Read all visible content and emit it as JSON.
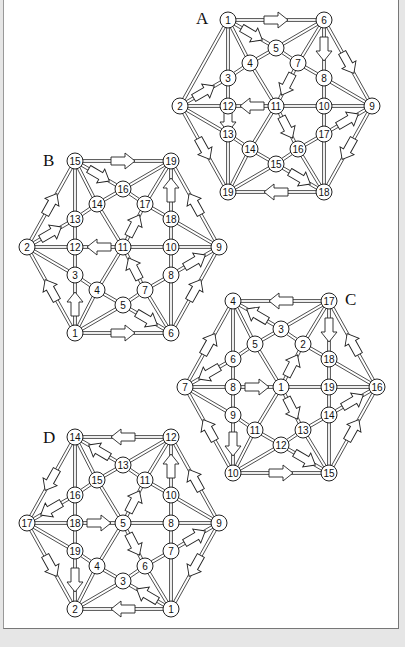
{
  "colors": {
    "background": "#e6e6e6",
    "panel": "#ffffff",
    "ink": "#222222"
  },
  "template": {
    "slots": {
      "L": [
        0,
        0
      ],
      "TL": [
        48,
        -86
      ],
      "TR": [
        144,
        -86
      ],
      "R": [
        192,
        0
      ],
      "BR": [
        144,
        86
      ],
      "BL": [
        48,
        86
      ],
      "a": [
        96,
        -58
      ],
      "b": [
        70,
        -43
      ],
      "c": [
        118,
        -43
      ],
      "d": [
        48,
        -28
      ],
      "e": [
        144,
        -28
      ],
      "f": [
        48,
        0
      ],
      "g": [
        96,
        0
      ],
      "h": [
        144,
        0
      ],
      "i": [
        48,
        28
      ],
      "j": [
        144,
        28
      ],
      "k": [
        70,
        43
      ],
      "l": [
        118,
        43
      ],
      "m": [
        96,
        58
      ]
    },
    "edges": [
      [
        "L",
        "TL"
      ],
      [
        "TL",
        "TR"
      ],
      [
        "TR",
        "R"
      ],
      [
        "R",
        "BR"
      ],
      [
        "BR",
        "BL"
      ],
      [
        "BL",
        "L"
      ],
      [
        "TL",
        "a"
      ],
      [
        "TL",
        "b"
      ],
      [
        "TL",
        "d"
      ],
      [
        "TR",
        "a"
      ],
      [
        "TR",
        "c"
      ],
      [
        "TR",
        "e"
      ],
      [
        "R",
        "e"
      ],
      [
        "R",
        "h"
      ],
      [
        "R",
        "j"
      ],
      [
        "BR",
        "j"
      ],
      [
        "BR",
        "l"
      ],
      [
        "BR",
        "m"
      ],
      [
        "BL",
        "m"
      ],
      [
        "BL",
        "k"
      ],
      [
        "BL",
        "i"
      ],
      [
        "L",
        "d"
      ],
      [
        "L",
        "f"
      ],
      [
        "L",
        "i"
      ],
      [
        "a",
        "b"
      ],
      [
        "a",
        "c"
      ],
      [
        "b",
        "d"
      ],
      [
        "c",
        "e"
      ],
      [
        "d",
        "f"
      ],
      [
        "f",
        "i"
      ],
      [
        "i",
        "k"
      ],
      [
        "k",
        "m"
      ],
      [
        "m",
        "l"
      ],
      [
        "l",
        "j"
      ],
      [
        "j",
        "h"
      ],
      [
        "h",
        "e"
      ],
      [
        "b",
        "g"
      ],
      [
        "c",
        "g"
      ],
      [
        "f",
        "g"
      ],
      [
        "g",
        "h"
      ],
      [
        "g",
        "k"
      ],
      [
        "g",
        "l"
      ]
    ]
  },
  "diagrams": [
    {
      "label": "A",
      "origin": [
        180,
        106
      ],
      "label_pos": [
        196,
        24
      ],
      "nodes": {
        "L": "2",
        "TL": "1",
        "TR": "6",
        "R": "9",
        "BR": "18",
        "BL": "19",
        "a": "5",
        "b": "4",
        "c": "7",
        "d": "3",
        "e": "8",
        "f": "12",
        "g": "11",
        "h": "10",
        "i": "13",
        "j": "17",
        "k": "14",
        "l": "16",
        "m": "15"
      },
      "arrows": [
        [
          "TL",
          "TR"
        ],
        [
          "TL",
          "a"
        ],
        [
          "TR",
          "e"
        ],
        [
          "TR",
          "R"
        ],
        [
          "L",
          "d"
        ],
        [
          "g",
          "f"
        ],
        [
          "c",
          "g"
        ],
        [
          "g",
          "l"
        ],
        [
          "f",
          "i"
        ],
        [
          "L",
          "BL"
        ],
        [
          "R",
          "BR"
        ],
        [
          "j",
          "R"
        ],
        [
          "m",
          "BR"
        ],
        [
          "BR",
          "BL"
        ]
      ]
    },
    {
      "label": "B",
      "origin": [
        27,
        247
      ],
      "label_pos": [
        43,
        166
      ],
      "nodes": {
        "L": "2",
        "TL": "15",
        "TR": "19",
        "R": "9",
        "BR": "6",
        "BL": "1",
        "a": "16",
        "b": "14",
        "c": "17",
        "d": "13",
        "e": "18",
        "f": "12",
        "g": "11",
        "h": "10",
        "i": "3",
        "j": "8",
        "k": "4",
        "l": "7",
        "m": "5"
      },
      "arrows": [
        [
          "TL",
          "TR"
        ],
        [
          "TL",
          "a"
        ],
        [
          "e",
          "TR"
        ],
        [
          "R",
          "TR"
        ],
        [
          "L",
          "TL"
        ],
        [
          "L",
          "d"
        ],
        [
          "g",
          "f"
        ],
        [
          "g",
          "c"
        ],
        [
          "l",
          "g"
        ],
        [
          "BL",
          "i"
        ],
        [
          "BL",
          "L"
        ],
        [
          "BL",
          "BR"
        ],
        [
          "m",
          "BR"
        ],
        [
          "j",
          "R"
        ],
        [
          "BR",
          "R"
        ]
      ]
    },
    {
      "label": "C",
      "origin": [
        185,
        387
      ],
      "label_pos": [
        345,
        305
      ],
      "nodes": {
        "L": "7",
        "TL": "4",
        "TR": "17",
        "R": "16",
        "BR": "15",
        "BL": "10",
        "a": "3",
        "b": "5",
        "c": "2",
        "d": "6",
        "e": "18",
        "f": "8",
        "g": "1",
        "h": "19",
        "i": "9",
        "j": "14",
        "k": "11",
        "l": "13",
        "m": "12"
      },
      "arrows": [
        [
          "TR",
          "TL"
        ],
        [
          "a",
          "TL"
        ],
        [
          "TR",
          "e"
        ],
        [
          "BR",
          "R"
        ],
        [
          "d",
          "L"
        ],
        [
          "L",
          "TL"
        ],
        [
          "f",
          "g"
        ],
        [
          "g",
          "c"
        ],
        [
          "g",
          "l"
        ],
        [
          "i",
          "BL"
        ],
        [
          "BL",
          "L"
        ],
        [
          "BL",
          "BR"
        ],
        [
          "m",
          "BR"
        ],
        [
          "j",
          "R"
        ],
        [
          "R",
          "TR"
        ]
      ]
    },
    {
      "label": "D",
      "origin": [
        27,
        523
      ],
      "label_pos": [
        43,
        443
      ],
      "nodes": {
        "L": "17",
        "TL": "14",
        "TR": "12",
        "R": "9",
        "BR": "1",
        "BL": "2",
        "a": "13",
        "b": "15",
        "c": "11",
        "d": "16",
        "e": "10",
        "f": "18",
        "g": "5",
        "h": "8",
        "i": "19",
        "j": "7",
        "k": "4",
        "l": "6",
        "m": "3"
      },
      "arrows": [
        [
          "TR",
          "TL"
        ],
        [
          "a",
          "TL"
        ],
        [
          "e",
          "TR"
        ],
        [
          "R",
          "TR"
        ],
        [
          "TL",
          "L"
        ],
        [
          "d",
          "L"
        ],
        [
          "f",
          "g"
        ],
        [
          "g",
          "c"
        ],
        [
          "g",
          "l"
        ],
        [
          "i",
          "BL"
        ],
        [
          "L",
          "BL"
        ],
        [
          "BR",
          "BL"
        ],
        [
          "BR",
          "m"
        ],
        [
          "j",
          "R"
        ],
        [
          "R",
          "BR"
        ]
      ]
    }
  ]
}
